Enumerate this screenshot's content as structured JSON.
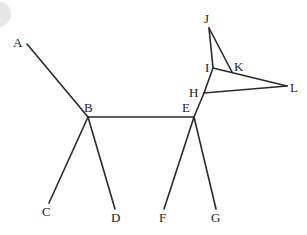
{
  "diagram": {
    "type": "graph",
    "nodes": [
      {
        "id": "A",
        "label": "A",
        "x": 27,
        "y": 44,
        "lx": 13,
        "ly": 47
      },
      {
        "id": "B",
        "label": "B",
        "x": 88,
        "y": 117,
        "lx": 84,
        "ly": 112
      },
      {
        "id": "C",
        "label": "C",
        "x": 49,
        "y": 203,
        "lx": 42,
        "ly": 216
      },
      {
        "id": "D",
        "label": "D",
        "x": 115,
        "y": 209,
        "lx": 111,
        "ly": 222
      },
      {
        "id": "E",
        "label": "E",
        "x": 194,
        "y": 117,
        "lx": 182,
        "ly": 112
      },
      {
        "id": "F",
        "label": "F",
        "x": 164,
        "y": 209,
        "lx": 159,
        "ly": 222
      },
      {
        "id": "G",
        "label": "G",
        "x": 216,
        "y": 209,
        "lx": 211,
        "ly": 222
      },
      {
        "id": "H",
        "label": "H",
        "x": 204,
        "y": 93,
        "lx": 189,
        "ly": 97
      },
      {
        "id": "I",
        "label": "I",
        "x": 213,
        "y": 68,
        "lx": 205,
        "ly": 72
      },
      {
        "id": "J",
        "label": "J",
        "x": 209,
        "y": 28,
        "lx": 204,
        "ly": 23
      },
      {
        "id": "K",
        "label": "K",
        "x": 232,
        "y": 72,
        "lx": 234,
        "ly": 71
      },
      {
        "id": "L",
        "label": "L",
        "x": 287,
        "y": 86,
        "lx": 290,
        "ly": 92
      }
    ],
    "edges": [
      [
        "A",
        "B"
      ],
      [
        "B",
        "E"
      ],
      [
        "B",
        "C"
      ],
      [
        "B",
        "D"
      ],
      [
        "E",
        "F"
      ],
      [
        "E",
        "G"
      ],
      [
        "E",
        "H"
      ],
      [
        "H",
        "I"
      ],
      [
        "H",
        "L"
      ],
      [
        "I",
        "L"
      ],
      [
        "I",
        "J"
      ],
      [
        "J",
        "K"
      ]
    ]
  }
}
